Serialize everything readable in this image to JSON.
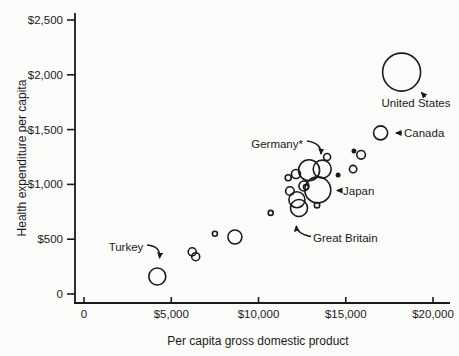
{
  "colors": {
    "ink": "#1a1a1a",
    "paper": "#fcfcfa"
  },
  "annotations": {
    "turkey": "Turkey",
    "germany": "Germany*",
    "japan": "Japan",
    "great_britain": "Great Britain",
    "canada": "Canada",
    "united_states": "United States"
  },
  "chart_data": {
    "type": "scatter",
    "subtype": "bubble",
    "point_style": "open-circle",
    "xlabel": "Per capita gross domestic product",
    "ylabel": "Health expenditure per capita",
    "xlim": [
      0,
      20000
    ],
    "ylim": [
      0,
      2500
    ],
    "grid": false,
    "legend": "none",
    "x_ticks": [
      {
        "value": 0,
        "label": "0"
      },
      {
        "value": 5000,
        "label": "$5,000"
      },
      {
        "value": 10000,
        "label": "$10,000"
      },
      {
        "value": 15000,
        "label": "$15,000"
      },
      {
        "value": 20000,
        "label": "$20,000"
      }
    ],
    "y_ticks": [
      {
        "value": 0,
        "label": "0"
      },
      {
        "value": 500,
        "label": "$500"
      },
      {
        "value": 1000,
        "label": "$1,000"
      },
      {
        "value": 1500,
        "label": "$1,500"
      },
      {
        "value": 2000,
        "label": "$2,000"
      },
      {
        "value": 2500,
        "label": "$2,500"
      }
    ],
    "points": [
      {
        "gdp": 4200,
        "health": 160,
        "size": 8.5,
        "filled": false,
        "label": "Turkey"
      },
      {
        "gdp": 6200,
        "health": 385,
        "size": 4.0,
        "filled": false,
        "label": ""
      },
      {
        "gdp": 6400,
        "health": 340,
        "size": 4.0,
        "filled": false,
        "label": ""
      },
      {
        "gdp": 7500,
        "health": 550,
        "size": 2.5,
        "filled": false,
        "label": ""
      },
      {
        "gdp": 8650,
        "health": 520,
        "size": 7.0,
        "filled": false,
        "label": ""
      },
      {
        "gdp": 10700,
        "health": 740,
        "size": 2.5,
        "filled": false,
        "label": ""
      },
      {
        "gdp": 11700,
        "health": 1060,
        "size": 3.0,
        "filled": false,
        "label": ""
      },
      {
        "gdp": 12150,
        "health": 1095,
        "size": 4.5,
        "filled": false,
        "label": ""
      },
      {
        "gdp": 12900,
        "health": 1130,
        "size": 10.5,
        "filled": false,
        "label": ""
      },
      {
        "gdp": 13650,
        "health": 1140,
        "size": 9.0,
        "filled": false,
        "label": "Germany*"
      },
      {
        "gdp": 13930,
        "health": 1250,
        "size": 3.5,
        "filled": false,
        "label": ""
      },
      {
        "gdp": 15470,
        "health": 1305,
        "size": 1.7,
        "filled": true,
        "label": ""
      },
      {
        "gdp": 15880,
        "health": 1270,
        "size": 4.3,
        "filled": false,
        "label": ""
      },
      {
        "gdp": 15420,
        "health": 1140,
        "size": 3.7,
        "filled": false,
        "label": ""
      },
      {
        "gdp": 14560,
        "health": 1085,
        "size": 1.7,
        "filled": true,
        "label": ""
      },
      {
        "gdp": 12600,
        "health": 985,
        "size": 5.0,
        "filled": false,
        "label": ""
      },
      {
        "gdp": 12720,
        "health": 975,
        "size": 2.5,
        "filled": false,
        "label": ""
      },
      {
        "gdp": 11800,
        "health": 940,
        "size": 4.3,
        "filled": false,
        "label": ""
      },
      {
        "gdp": 13400,
        "health": 950,
        "size": 13.0,
        "filled": false,
        "label": "Japan"
      },
      {
        "gdp": 12200,
        "health": 860,
        "size": 8.0,
        "filled": false,
        "label": ""
      },
      {
        "gdp": 12320,
        "health": 785,
        "size": 8.5,
        "filled": false,
        "label": "Great Britain"
      },
      {
        "gdp": 13350,
        "health": 810,
        "size": 2.7,
        "filled": false,
        "label": ""
      },
      {
        "gdp": 17000,
        "health": 1470,
        "size": 7.0,
        "filled": false,
        "label": "Canada"
      },
      {
        "gdp": 18200,
        "health": 2025,
        "size": 19.0,
        "filled": false,
        "label": "United States"
      }
    ]
  }
}
